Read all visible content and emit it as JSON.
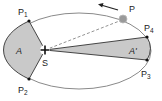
{
  "diagram": {
    "labels": {
      "p": "P",
      "p1": "P",
      "p1_sub": "1",
      "p2": "P",
      "p2_sub": "2",
      "p3": "P",
      "p3_sub": "3",
      "p4": "P",
      "p4_sub": "4",
      "s": "S",
      "area_a": "A",
      "area_a_prime": "A'"
    },
    "colors": {
      "orbit": "#8a8a8a",
      "area_fill": "#c9c9c9",
      "area_stroke": "#333333",
      "planet": "#9a9a9a",
      "point": "#111111",
      "dashed": "#777777",
      "arrow": "#222222"
    }
  }
}
